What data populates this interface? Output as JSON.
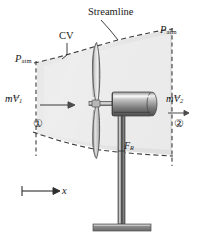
{
  "figure": {
    "colors": {
      "cv_fill": "#e2e2e2",
      "cv_fill_light": "#f2f2f2",
      "dashed_line": "#3a3a3a",
      "metal_dark": "#5a5a5a",
      "metal_mid": "#9a9a9a",
      "metal_light": "#d8d8d8",
      "blade_edge": "#4a4a4a",
      "text": "#1a1a1a"
    },
    "labels": {
      "streamline": "Streamline",
      "cv": "CV",
      "p_atm_left": "P",
      "p_atm_left_sub": "atm",
      "p_atm_right": "P",
      "p_atm_right_sub": "atm",
      "mdot_v1_m": "m",
      "mdot_v1_v": "V",
      "mdot_v1_sub": "1",
      "mdot_v2_m": "m",
      "mdot_v2_v": "V",
      "mdot_v2_sub": "2",
      "force_r": "F",
      "force_r_sub": "R",
      "x_axis": "x",
      "station_one": "①",
      "station_two": "②"
    },
    "icons": {
      "inlet_arrow": "right-arrow-icon",
      "outlet_arrow": "right-arrow-icon",
      "x_axis_arrow": "right-arrow-icon",
      "streamline_leader": "leader-line-icon",
      "cv_leader": "leader-line-icon",
      "vector_overbar": "vector-arrow-icon"
    },
    "parts": {
      "propeller": "propeller-blades",
      "hub": "rotor-hub",
      "nacelle": "nacelle-cylinder",
      "tower": "support-tower",
      "base": "base-plate"
    }
  }
}
